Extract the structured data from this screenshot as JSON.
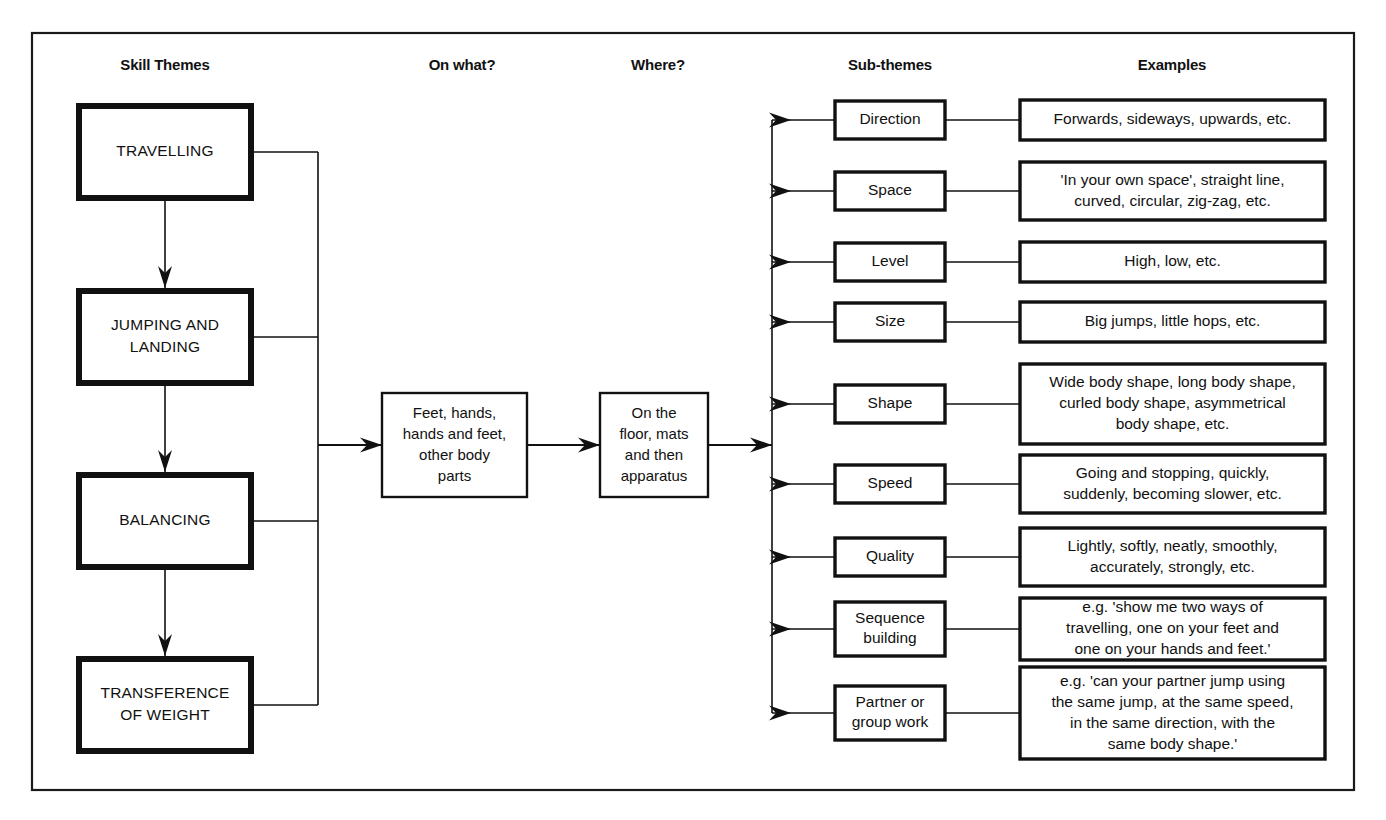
{
  "diagram": {
    "frame_color": "#1a1a1a",
    "columns": [
      {
        "id": "skill-themes",
        "label": "Skill Themes",
        "x": 165
      },
      {
        "id": "on-what",
        "label": "On what?",
        "x": 462
      },
      {
        "id": "where",
        "label": "Where?",
        "x": 658
      },
      {
        "id": "sub-themes",
        "label": "Sub-themes",
        "x": 890
      },
      {
        "id": "examples",
        "label": "Examples",
        "x": 1172
      }
    ],
    "skill_themes": [
      {
        "id": "travelling",
        "label": "TRAVELLING",
        "lines": [
          "TRAVELLING"
        ],
        "y": 152
      },
      {
        "id": "jumping-and-landing",
        "label": "JUMPING AND LANDING",
        "lines": [
          "JUMPING AND",
          "LANDING"
        ],
        "y": 337
      },
      {
        "id": "balancing",
        "label": "BALANCING",
        "lines": [
          "BALANCING"
        ],
        "y": 521
      },
      {
        "id": "transference-of-weight",
        "label": "TRANSFERENCE OF WEIGHT",
        "lines": [
          "TRANSFERENCE",
          "OF WEIGHT"
        ],
        "y": 705
      }
    ],
    "on_what": {
      "id": "on-what-box",
      "lines": [
        "Feet, hands,",
        "hands and feet,",
        "other body",
        "parts"
      ]
    },
    "where": {
      "id": "where-box",
      "lines": [
        "On the",
        "floor, mats",
        "and then",
        "apparatus"
      ]
    },
    "rows": [
      {
        "id": "direction",
        "subtheme": {
          "lines": [
            "Direction"
          ]
        },
        "example": {
          "lines": [
            "Forwards, sideways, upwards, etc."
          ]
        }
      },
      {
        "id": "space",
        "subtheme": {
          "lines": [
            "Space"
          ]
        },
        "example": {
          "lines": [
            "'In your own space', straight line,",
            "curved, circular, zig-zag, etc."
          ]
        }
      },
      {
        "id": "level",
        "subtheme": {
          "lines": [
            "Level"
          ]
        },
        "example": {
          "lines": [
            "High, low, etc."
          ]
        }
      },
      {
        "id": "size",
        "subtheme": {
          "lines": [
            "Size"
          ]
        },
        "example": {
          "lines": [
            "Big jumps, little hops, etc."
          ]
        }
      },
      {
        "id": "shape",
        "subtheme": {
          "lines": [
            "Shape"
          ]
        },
        "example": {
          "lines": [
            "Wide body shape, long body shape,",
            "curled body shape, asymmetrical",
            "body shape, etc."
          ]
        }
      },
      {
        "id": "speed",
        "subtheme": {
          "lines": [
            "Speed"
          ]
        },
        "example": {
          "lines": [
            "Going and stopping, quickly,",
            "suddenly, becoming slower, etc."
          ]
        }
      },
      {
        "id": "quality",
        "subtheme": {
          "lines": [
            "Quality"
          ]
        },
        "example": {
          "lines": [
            "Lightly, softly, neatly, smoothly,",
            "accurately, strongly, etc."
          ]
        }
      },
      {
        "id": "sequence-building",
        "subtheme": {
          "lines": [
            "Sequence",
            "building"
          ]
        },
        "example": {
          "lines": [
            "e.g. 'show me two ways of",
            "travelling, one on your feet and",
            "one on your hands and feet.'"
          ]
        }
      },
      {
        "id": "partner-or-group-work",
        "subtheme": {
          "lines": [
            "Partner or",
            "group work"
          ]
        },
        "example": {
          "lines": [
            "e.g. 'can your partner jump using",
            "the same jump, at the same speed,",
            "in the same direction, with the",
            "same body shape.'"
          ]
        }
      }
    ]
  }
}
